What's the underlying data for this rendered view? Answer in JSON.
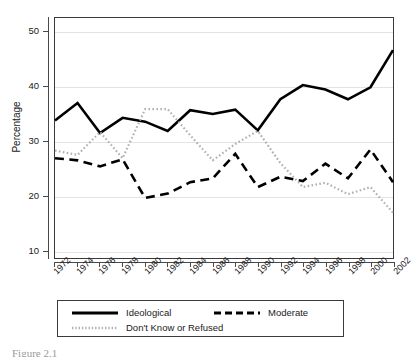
{
  "figure": {
    "caption": "Figure 2.1"
  },
  "chart_data": {
    "type": "line",
    "title": "",
    "subtitle": "",
    "xlabel": "",
    "ylabel": "Percentage",
    "x": [
      1972,
      1974,
      1976,
      1978,
      1980,
      1982,
      1984,
      1986,
      1988,
      1990,
      1992,
      1994,
      1996,
      1998,
      2000,
      2002
    ],
    "tick_labels": [
      "1972",
      "1974",
      "1976",
      "1978",
      "1980",
      "1982",
      "1984",
      "1986",
      "1988",
      "1990",
      "1992",
      "1994",
      "1996",
      "1998",
      "2000",
      "2002"
    ],
    "xlim": [
      1972,
      2002
    ],
    "ylim": [
      8.5,
      52.5
    ],
    "yticks": [
      10,
      20,
      30,
      40,
      50
    ],
    "ytick_labels": [
      "10",
      "20",
      "30",
      "40",
      "50"
    ],
    "grid": "horizontal",
    "grid_color": "#e3e3e3",
    "legend_position": "below-plot",
    "series": [
      {
        "name": "Ideological",
        "style": "solid",
        "color": "#000000",
        "width": 2.6,
        "values": [
          33.7,
          36.9,
          31.4,
          34.2,
          33.5,
          31.8,
          35.6,
          34.9,
          35.7,
          31.9,
          37.6,
          40.2,
          39.4,
          37.6,
          39.8,
          46.6
        ]
      },
      {
        "name": "Moderate",
        "style": "dashed",
        "color": "#000000",
        "width": 2.6,
        "values": [
          26.8,
          26.4,
          25.3,
          26.6,
          19.5,
          20.3,
          22.4,
          23.1,
          27.6,
          21.5,
          23.4,
          22.6,
          25.8,
          23.1,
          28.4,
          22.4
        ]
      },
      {
        "name": "Don't Know or Refused",
        "style": "dotted",
        "color": "#b0b0b0",
        "width": 2.2,
        "values": [
          28.2,
          27.4,
          31.6,
          26.8,
          35.8,
          35.8,
          31.0,
          26.4,
          29.4,
          31.8,
          25.9,
          21.5,
          22.3,
          20.2,
          21.5,
          16.8
        ]
      }
    ]
  },
  "legend": {
    "items": [
      {
        "label": "Ideological",
        "style": "solid"
      },
      {
        "label": "Moderate",
        "style": "dashed"
      },
      {
        "label": "Don't Know or Refused",
        "style": "dotted"
      }
    ]
  }
}
